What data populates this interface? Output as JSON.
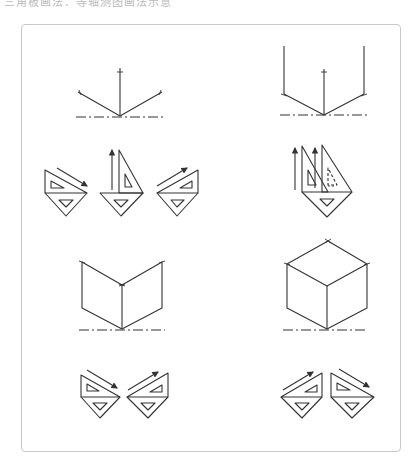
{
  "caption": "三角板画法：等轴测图画法示意",
  "figures": [
    {
      "id": "axes-fan",
      "description": "isometric axes from base point"
    },
    {
      "id": "axes-with-verticals",
      "description": "isometric axes with vertical edges"
    },
    {
      "id": "triangles-row1-left",
      "description": "set-square combinations for 30° lines and vertical"
    },
    {
      "id": "triangles-row1-right",
      "description": "set-squares drawing verticals"
    },
    {
      "id": "two-faces",
      "description": "two visible faces"
    },
    {
      "id": "cube",
      "description": "complete isometric cube"
    },
    {
      "id": "triangles-row2-left",
      "description": "set-squares drawing 30° lines"
    },
    {
      "id": "triangles-row2-right",
      "description": "set-squares drawing 30° lines mirrored"
    }
  ],
  "colors": {
    "line": "#333333",
    "frame": "#c8c8c8",
    "background": "#ffffff"
  }
}
